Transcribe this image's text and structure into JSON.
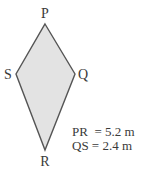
{
  "figure": {
    "shape": "kite",
    "fill_color": "#e3e3e3",
    "stroke_color": "#555555",
    "vertices": {
      "P": {
        "label": "P"
      },
      "Q": {
        "label": "Q"
      },
      "R": {
        "label": "R"
      },
      "S": {
        "label": "S"
      }
    },
    "measurements": [
      {
        "label": "PR  = 5.2 m"
      },
      {
        "label": "QS = 2.4 m"
      }
    ]
  }
}
